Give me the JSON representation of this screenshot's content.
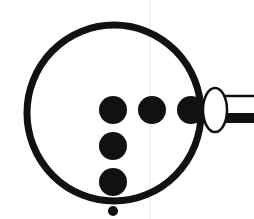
{
  "diagram": {
    "title": "",
    "colors": {
      "ink": "#111111",
      "paper": "#ffffff",
      "guide": "#e4e4e4"
    },
    "ring": {
      "cx": 114,
      "cy": 113,
      "rx": 87,
      "ry": 89,
      "stroke_width": 7
    },
    "dots": [
      {
        "cx": 113,
        "cy": 110,
        "r": 14
      },
      {
        "cx": 152,
        "cy": 110,
        "r": 14
      },
      {
        "cx": 191,
        "cy": 110,
        "r": 14
      },
      {
        "cx": 113,
        "cy": 146,
        "r": 14
      },
      {
        "cx": 113,
        "cy": 182,
        "r": 14
      },
      {
        "cx": 113,
        "cy": 211,
        "r": 5
      }
    ],
    "connector": {
      "cx": 215,
      "cy": 110,
      "rx": 12,
      "ry": 22
    },
    "handle": {
      "x": 226,
      "top_y": 95,
      "bottom_y": 123,
      "x_end": 254
    }
  }
}
